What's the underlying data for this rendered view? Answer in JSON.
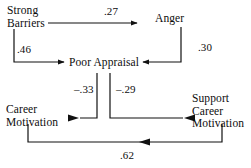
{
  "diagram": {
    "type": "path-diagram",
    "background_color": "#ffffff",
    "line_color": "#111111",
    "nodes": [
      {
        "id": "strong-barriers",
        "label_lines": [
          "Strong",
          "Barriers"
        ]
      },
      {
        "id": "anger",
        "label_lines": [
          "Anger"
        ]
      },
      {
        "id": "poor-appraisal",
        "label_lines": [
          "Poor Appraisal"
        ]
      },
      {
        "id": "career-motivation",
        "label_lines": [
          "Career",
          "Motivation"
        ]
      },
      {
        "id": "support-career-motivation",
        "label_lines": [
          "Support",
          "Career",
          "Motivation"
        ]
      }
    ],
    "paths": [
      {
        "id": "barriers-to-anger",
        "from": "strong-barriers",
        "to": "anger",
        "coefficient": ".27"
      },
      {
        "id": "anger-to-appraisal",
        "from": "anger",
        "to": "poor-appraisal",
        "coefficient": ".30"
      },
      {
        "id": "barriers-to-appraisal",
        "from": "strong-barriers",
        "to": "poor-appraisal",
        "coefficient": ".46"
      },
      {
        "id": "career-mot-to-appraisal",
        "from": "career-motivation",
        "to": "poor-appraisal",
        "coefficient": "–.33"
      },
      {
        "id": "support-career-to-appraisal",
        "from": "support-career-motivation",
        "to": "poor-appraisal",
        "coefficient": "–.29"
      },
      {
        "id": "support-career-to-career-mot",
        "from": "support-career-motivation",
        "to": "career-motivation",
        "coefficient": ".62"
      }
    ]
  },
  "labels": {
    "strong_barriers_line1": "Strong",
    "strong_barriers_line2": "Barriers",
    "anger": "Anger",
    "poor_appraisal": "Poor Appraisal",
    "career_motivation_line1": "Career",
    "career_motivation_line2": "Motivation",
    "support_career_line1": "Support",
    "support_career_line2": "Career",
    "support_career_line3": "Motivation"
  },
  "coefficients": {
    "barriers_anger": ".27",
    "anger_appraisal": ".30",
    "barriers_appraisal": ".46",
    "career_appraisal": "–.33",
    "support_appraisal": "–.29",
    "support_career": ".62"
  }
}
